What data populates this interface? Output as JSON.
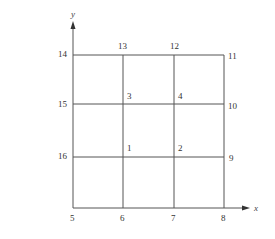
{
  "diagram": {
    "type": "finite-element-mesh",
    "colors": {
      "line": "#555555",
      "text": "#333333",
      "background": "#ffffff"
    },
    "axes": {
      "x_label": "x",
      "y_label": "y"
    },
    "grid": {
      "x_lines": [
        73,
        123,
        174,
        224
      ],
      "y_lines": [
        55,
        104,
        157,
        208
      ]
    },
    "nodes": [
      {
        "id": "1",
        "label": "1",
        "x": 123,
        "y": 157,
        "lx": 127,
        "ly": 151
      },
      {
        "id": "2",
        "label": "2",
        "x": 174,
        "y": 157,
        "lx": 178,
        "ly": 151
      },
      {
        "id": "3",
        "label": "3",
        "x": 123,
        "y": 104,
        "lx": 127,
        "ly": 99
      },
      {
        "id": "4",
        "label": "4",
        "x": 174,
        "y": 104,
        "lx": 178,
        "ly": 99
      },
      {
        "id": "5",
        "label": "5",
        "x": 73,
        "y": 208,
        "lx": 70,
        "ly": 221
      },
      {
        "id": "6",
        "label": "6",
        "x": 123,
        "y": 208,
        "lx": 120,
        "ly": 221
      },
      {
        "id": "7",
        "label": "7",
        "x": 174,
        "y": 208,
        "lx": 171,
        "ly": 221
      },
      {
        "id": "8",
        "label": "8",
        "x": 224,
        "y": 208,
        "lx": 221,
        "ly": 221
      },
      {
        "id": "9",
        "label": "9",
        "x": 224,
        "y": 157,
        "lx": 229,
        "ly": 161
      },
      {
        "id": "10",
        "label": "10",
        "x": 224,
        "y": 104,
        "lx": 228,
        "ly": 109
      },
      {
        "id": "11",
        "label": "11",
        "x": 224,
        "y": 55,
        "lx": 228,
        "ly": 59
      },
      {
        "id": "12",
        "label": "12",
        "x": 174,
        "y": 55,
        "lx": 170,
        "ly": 49
      },
      {
        "id": "13",
        "label": "13",
        "x": 123,
        "y": 55,
        "lx": 118,
        "ly": 49
      },
      {
        "id": "14",
        "label": "14",
        "x": 73,
        "y": 55,
        "lx": 58,
        "ly": 57
      },
      {
        "id": "15",
        "label": "15",
        "x": 73,
        "y": 104,
        "lx": 58,
        "ly": 107
      },
      {
        "id": "16",
        "label": "16",
        "x": 73,
        "y": 157,
        "lx": 58,
        "ly": 159
      }
    ]
  }
}
